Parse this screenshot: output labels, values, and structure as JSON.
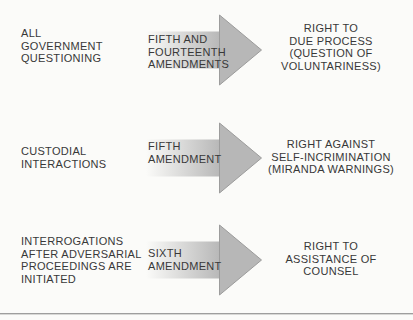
{
  "diagram": {
    "arrow_icon": "right-arrow",
    "rows": [
      {
        "trigger": "ALL\nGOVERNMENT\nQUESTIONING",
        "amendment": "FIFTH AND\nFOURTEENTH\nAMENDMENTS",
        "right_label": "RIGHT TO\nDUE PROCESS\n(QUESTION OF\nVOLUNTARINESS)"
      },
      {
        "trigger": "CUSTODIAL\nINTERACTIONS",
        "amendment": "FIFTH\nAMENDMENT",
        "right_label": "RIGHT AGAINST\nSELF-INCRIMINATION\n(MIRANDA WARNINGS)"
      },
      {
        "trigger": "INTERROGATIONS\nAFTER ADVERSARIAL\nPROCEEDINGS ARE\nINITIATED",
        "amendment": "SIXTH\nAMENDMENT",
        "right_label": "RIGHT TO\nASSISTANCE OF\nCOUNSEL"
      }
    ]
  },
  "colors": {
    "background": "#fbfbf9",
    "text": "#383838",
    "arrow_fill": "#b7b7b7",
    "arrow_edge": "#9c9c9c",
    "divider": "#9e9e9e"
  }
}
